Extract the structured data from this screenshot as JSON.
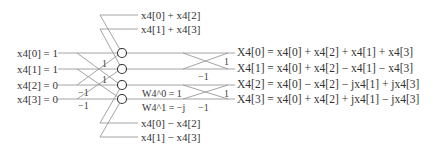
{
  "inputs": [
    {
      "label": "x4[0] = 1"
    },
    {
      "label": "x4[1] = 1"
    },
    {
      "label": "x4[2] = 0"
    },
    {
      "label": "x4[3] = 0"
    }
  ],
  "intermediate_top": [
    "x4[0] + x4[2]",
    "x4[1] + x4[3]"
  ],
  "intermediate_bottom": [
    "x4[0] − x4[2]",
    "x4[1] − x4[3]"
  ],
  "stage1_coefficients": [
    "1",
    "1",
    "−1",
    "−1"
  ],
  "stage2_coefficients": [
    "1",
    "−1",
    "1",
    "−1"
  ],
  "twiddles": [
    {
      "label": "W4^0 = 1"
    },
    {
      "label": "W4^1 = −j"
    }
  ],
  "outputs": [
    {
      "label": "X4[0] = x4[0] + x4[2] + x4[1] + x4[3]"
    },
    {
      "label": "X4[1] = x4[0] + x4[2] − x4[1] − x4[3]"
    },
    {
      "label": "X4[2] = x4[0] − x4[2] − jx4[1] + jx4[3]"
    },
    {
      "label": "X4[3] = x4[0] + x4[2] + jx4[1] − jx4[3]"
    }
  ],
  "colors": {
    "wire": "#9a9a9a",
    "node": "#333333",
    "text": "#333333"
  }
}
